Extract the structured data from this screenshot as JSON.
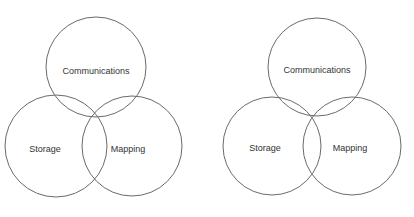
{
  "diagrams": [
    {
      "name": "venn-left",
      "circles": [
        {
          "label": "Communications",
          "cx": 96,
          "cy": 67,
          "r": 50,
          "tx": 96,
          "ty": 74
        },
        {
          "label": "Storage",
          "cx": 56,
          "cy": 146,
          "r": 51,
          "tx": 45,
          "ty": 152
        },
        {
          "label": "Mapping",
          "cx": 132,
          "cy": 146,
          "r": 50,
          "tx": 128,
          "ty": 152
        }
      ]
    },
    {
      "name": "venn-right",
      "circles": [
        {
          "label": "Communications",
          "cx": 317,
          "cy": 67,
          "r": 49,
          "tx": 317,
          "ty": 73
        },
        {
          "label": "Storage",
          "cx": 272,
          "cy": 146,
          "r": 49,
          "tx": 265,
          "ty": 151
        },
        {
          "label": "Mapping",
          "cx": 352,
          "cy": 146,
          "r": 49,
          "tx": 350,
          "ty": 151
        }
      ]
    }
  ],
  "colors": {
    "stroke": "#6a6a6a",
    "text": "#333333",
    "background": "#ffffff"
  }
}
